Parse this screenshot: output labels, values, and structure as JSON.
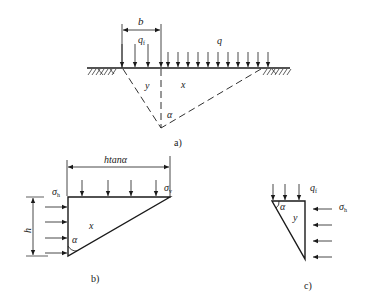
{
  "figure_a": {
    "caption": "a)",
    "dim_b": "b",
    "load_qf": "q",
    "load_qf_sub": "f",
    "load_q": "q",
    "region_y": "y",
    "region_x": "x",
    "angle": "α"
  },
  "figure_b": {
    "caption": "b)",
    "dim_top": "htanα",
    "dim_h": "h",
    "sigma_h": "σ",
    "sigma_h_sub": "h",
    "sigma_v": "σ",
    "sigma_v_sub": "v",
    "region": "x",
    "angle": "α"
  },
  "figure_c": {
    "caption": "c)",
    "load_qf": "q",
    "load_qf_sub": "f",
    "sigma_h": "σ",
    "sigma_h_sub": "h",
    "region": "y",
    "angle": "α"
  },
  "colors": {
    "ink": "#1a1a1a",
    "background": "#ffffff"
  }
}
